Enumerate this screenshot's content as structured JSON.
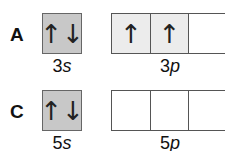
{
  "rows": [
    {
      "label": "A",
      "s": {
        "n": "3",
        "l": "s",
        "electrons": "↑↓"
      },
      "p": {
        "n": "3",
        "l": "p",
        "orbitals": [
          "↑",
          "↑",
          ""
        ]
      }
    },
    {
      "label": "C",
      "s": {
        "n": "5",
        "l": "s",
        "electrons": "↑↓"
      },
      "p": {
        "n": "5",
        "l": "p",
        "orbitals": [
          "",
          "",
          ""
        ]
      }
    }
  ],
  "colors": {
    "s_box_fill": "#c8c8c8",
    "p_box_filled": "#ececec",
    "p_box_empty": "#ffffff",
    "border": "#555555"
  }
}
